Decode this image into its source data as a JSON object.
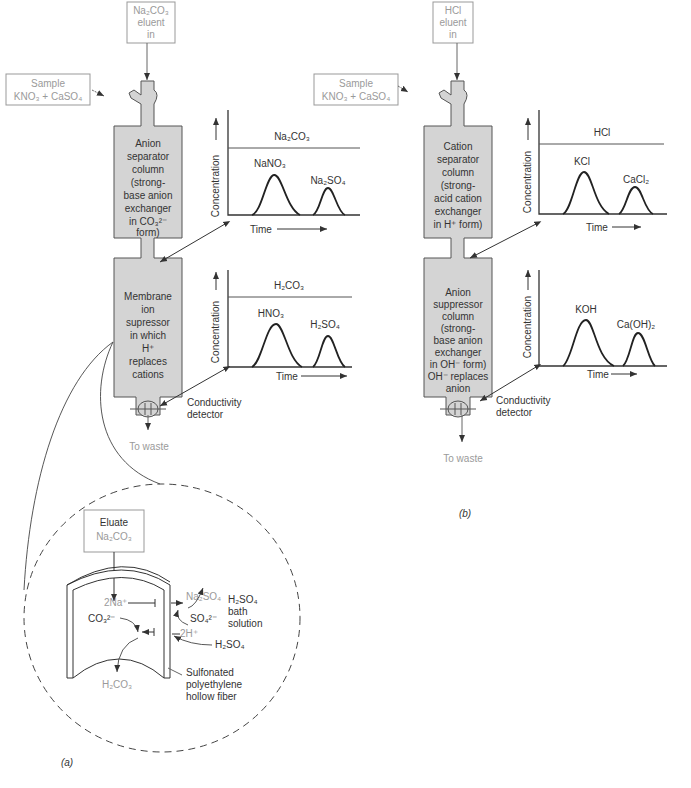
{
  "panel_a": {
    "caption": "(a)",
    "eluent_box": {
      "line1": "Na₂CO₃",
      "line2": "eluent",
      "line3": "in"
    },
    "sample_box": {
      "line1": "Sample",
      "line2": "KNO₃ + CaSO₄"
    },
    "separator_column": [
      "Anion",
      "separator",
      "column",
      "(strong-",
      "base anion",
      "exchanger",
      "in CO₃²⁻",
      "form)"
    ],
    "suppressor_column": [
      "Membrane",
      "ion",
      "supressor",
      "in which",
      "H⁺",
      "replaces",
      "cations"
    ],
    "detector_label": [
      "Conductivity",
      "detector"
    ],
    "waste_label": "To waste",
    "chart_top": {
      "baseline_label": "Na₂CO₃",
      "peak1": "NaNO₃",
      "peak2": "Na₂SO₄",
      "ylabel": "Concentration",
      "xlabel": "Time"
    },
    "chart_bottom": {
      "baseline_label": "H₂CO₃",
      "peak1": "HNO₃",
      "peak2": "H₂SO₄",
      "ylabel": "Concentration",
      "xlabel": "Time"
    },
    "inset": {
      "eluate_box": {
        "line1": "Eluate",
        "line2": "Na₂CO₃"
      },
      "na_ion": "2Na⁺",
      "co3_ion": "CO₃²⁻",
      "h_ion": "2H⁺",
      "so4_ion": "SO₄²⁻",
      "na2so4": "Na₂SO₄",
      "h2so4": "H₂SO₄",
      "h2co3": "H₂CO₃",
      "bath_label": [
        "H₂SO₄",
        "bath",
        "solution"
      ],
      "fiber_label": [
        "Sulfonated",
        "polyethylene",
        "hollow fiber"
      ]
    }
  },
  "panel_b": {
    "caption": "(b)",
    "eluent_box": {
      "line1": "HCl",
      "line2": "eluent",
      "line3": "in"
    },
    "sample_box": {
      "line1": "Sample",
      "line2": "KNO₃ + CaSO₄"
    },
    "separator_column": [
      "Cation",
      "separator",
      "column",
      "(strong-",
      "acid cation",
      "exchanger",
      "in H⁺ form)"
    ],
    "suppressor_column": [
      "Anion",
      "suppressor",
      "column",
      "(strong-",
      "base anion",
      "exchanger",
      "in OH⁻ form)",
      "OH⁻ replaces",
      "anion"
    ],
    "detector_label": [
      "Conductivity",
      "detector"
    ],
    "waste_label": "To waste",
    "chart_top": {
      "baseline_label": "HCl",
      "peak1": "KCl",
      "peak2": "CaCl₂",
      "ylabel": "Concentration",
      "xlabel": "Time"
    },
    "chart_bottom": {
      "baseline_label": "",
      "peak1": "KOH",
      "peak2": "Ca(OH)₂",
      "ylabel": "Concentration",
      "xlabel": "Time"
    }
  }
}
